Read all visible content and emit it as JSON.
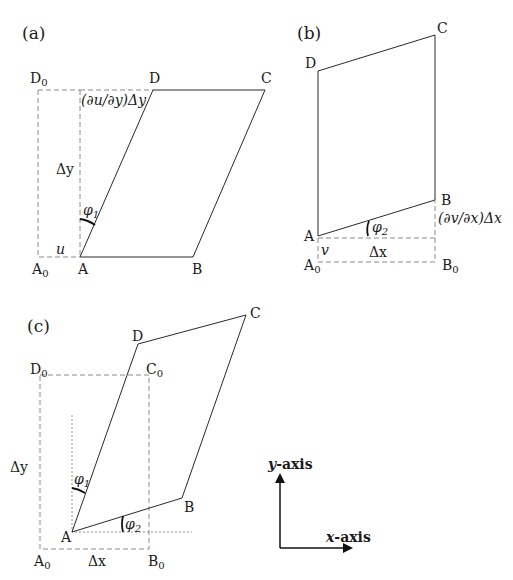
{
  "figure": {
    "colors": {
      "solid_line": "#2a2a2a",
      "dashed_line": "#8a8a8a",
      "dotted_line": "#777777",
      "text": "#1a1a1a"
    }
  },
  "panel_a": {
    "label": "(a)",
    "points": {
      "A0": "A",
      "A0_sub": "0",
      "A": "A",
      "B": "B",
      "C": "C",
      "D": "D",
      "D0": "D",
      "D0_sub": "0"
    },
    "annotations": {
      "shear_offset": "(∂u/∂y)Δy",
      "height": "Δy",
      "angle": "φ",
      "angle_sub": "1",
      "displacement": "u"
    }
  },
  "panel_b": {
    "label": "(b)",
    "points": {
      "A0": "A",
      "A0_sub": "0",
      "A": "A",
      "B": "B",
      "B0": "B",
      "B0_sub": "0",
      "C": "C",
      "D": "D"
    },
    "annotations": {
      "shear_offset": "(∂v/∂x)Δx",
      "width": "Δx",
      "angle": "φ",
      "angle_sub": "2",
      "displacement": "v"
    }
  },
  "panel_c": {
    "label": "(c)",
    "points": {
      "A0": "A",
      "A0_sub": "0",
      "A": "A",
      "B": "B",
      "B0": "B",
      "B0_sub": "0",
      "C": "C",
      "C0": "C",
      "C0_sub": "0",
      "D": "D",
      "D0": "D",
      "D0_sub": "0"
    },
    "annotations": {
      "height": "Δy",
      "width": "Δx",
      "angle1": "φ",
      "angle1_sub": "1",
      "angle2": "φ",
      "angle2_sub": "2"
    }
  },
  "axes_legend": {
    "y_var": "y",
    "y_suffix": "-axis",
    "x_var": "x",
    "x_suffix": "-axis"
  }
}
